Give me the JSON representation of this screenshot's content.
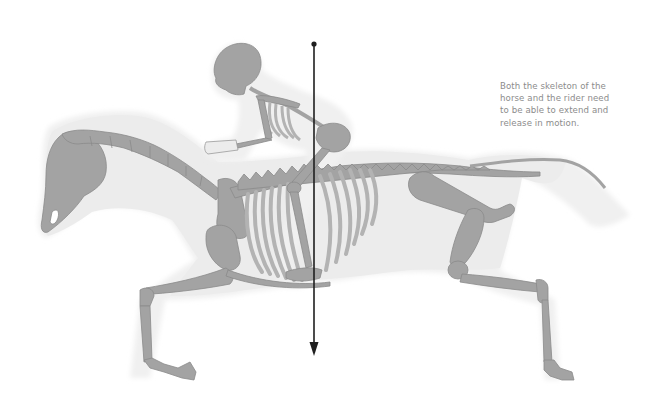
{
  "diagram": {
    "caption_lines": [
      "Both the skeleton of the",
      "horse and the rider need",
      "to be able to extend and",
      "release in motion."
    ],
    "balance_line": {
      "x": 314,
      "y_top": 44,
      "y_bottom": 355,
      "direction": "down"
    },
    "colors": {
      "background": "#ffffff",
      "body_silhouette": "#ececec",
      "silhouette_halo": "#f4f4f4",
      "bone_fill": "#a3a3a3",
      "bone_stroke": "#8a8a8a",
      "rib_fill": "#b3b3b3",
      "arrow": "#1f1f1f",
      "caption_text": "#8c8c8c"
    }
  }
}
